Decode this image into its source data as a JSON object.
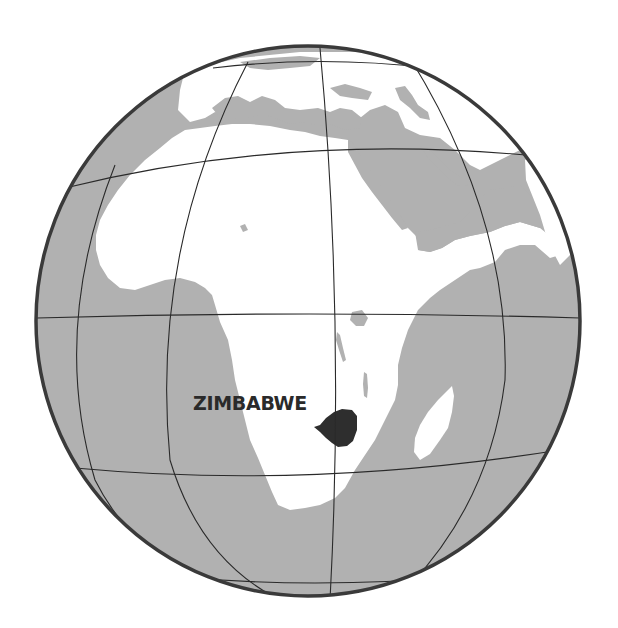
{
  "map": {
    "projection": "orthographic",
    "colors": {
      "ocean": "#b1b1b1",
      "land": "#ffffff",
      "highlight_country": "#2e2e2e",
      "graticule": "#2a2a2a",
      "globe_outline": "#3a3a3a",
      "label": "#2a2a2a"
    },
    "highlighted_country": "Zimbabwe",
    "labels": [
      {
        "text": "ZIMBABWE"
      }
    ]
  }
}
